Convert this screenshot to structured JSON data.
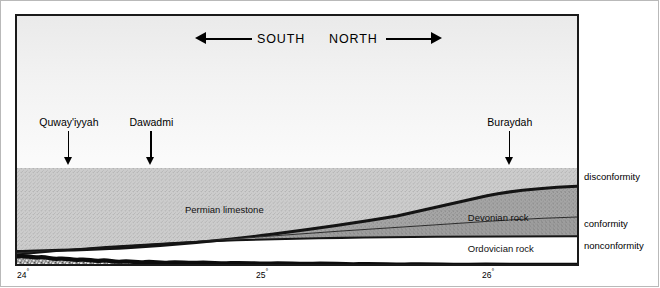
{
  "figure": {
    "type": "geologic-cross-section",
    "compass": {
      "south_label": "SOUTH",
      "north_label": "NORTH"
    },
    "cities": [
      {
        "name": "Quway'iyyah",
        "x_pct": 3.2
      },
      {
        "name": "Dawadmi",
        "x_pct": 24.0
      },
      {
        "name": "Buraydah",
        "x_pct": 88.0
      }
    ],
    "units": [
      {
        "name": "Permian limestone",
        "x_pct": 30.0,
        "y_px": 36
      },
      {
        "name": "Devonian rock",
        "x_pct": 85.0,
        "y_px": 50
      },
      {
        "name": "Ordovician rock",
        "x_pct": 85.0,
        "y_px": 80
      },
      {
        "name": "SHIELD ROCKS",
        "x_pct": 52.0,
        "y_px": 105
      }
    ],
    "boundaries": [
      {
        "label": "disconformity",
        "y_px": 171
      },
      {
        "label": "conformity",
        "y_px": 218
      },
      {
        "label": "nonconformity",
        "y_px": 240
      }
    ],
    "longitude_ticks": [
      {
        "value": "24",
        "degree": "°",
        "x_px": 17
      },
      {
        "value": "25",
        "degree": "°",
        "x_px": 256
      },
      {
        "value": "26",
        "degree": "°",
        "x_px": 482
      }
    ],
    "colors": {
      "frame": "#1a1a1a",
      "sky": "#f0f0f0",
      "permian": "#c9c9c9",
      "devonian": "#a3a3a3",
      "ordovician": "#9a9a9a",
      "shield": "#8f8f8f",
      "boundary_dark": "#141414"
    }
  }
}
